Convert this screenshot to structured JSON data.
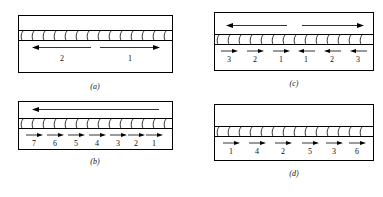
{
  "figure": {
    "caption_style": "italic-parenthetical",
    "panels": [
      {
        "id": "a",
        "caption": "(a)",
        "top_arrows": [],
        "segments": [
          {
            "label": "2",
            "direction": "left"
          },
          {
            "label": "1",
            "direction": "right"
          }
        ]
      },
      {
        "id": "b",
        "caption": "(b)",
        "top_arrows": [
          {
            "direction": "left",
            "span": "full"
          }
        ],
        "segments": [
          {
            "label": "7",
            "direction": "right"
          },
          {
            "label": "6",
            "direction": "right"
          },
          {
            "label": "5",
            "direction": "right"
          },
          {
            "label": "4",
            "direction": "right"
          },
          {
            "label": "3",
            "direction": "right"
          },
          {
            "label": "2",
            "direction": "right"
          },
          {
            "label": "1",
            "direction": "right"
          }
        ]
      },
      {
        "id": "c",
        "caption": "(c)",
        "top_arrows": [
          {
            "direction": "left",
            "span": "left-half"
          },
          {
            "direction": "right",
            "span": "right-half"
          }
        ],
        "segments": [
          {
            "label": "3",
            "direction": "right"
          },
          {
            "label": "2",
            "direction": "right"
          },
          {
            "label": "1",
            "direction": "right"
          },
          {
            "label": "1",
            "direction": "left"
          },
          {
            "label": "2",
            "direction": "left"
          },
          {
            "label": "3",
            "direction": "left"
          }
        ]
      },
      {
        "id": "d",
        "caption": "(d)",
        "top_arrows": [],
        "segments": [
          {
            "label": "1",
            "direction": "right"
          },
          {
            "label": "4",
            "direction": "right"
          },
          {
            "label": "2",
            "direction": "right"
          },
          {
            "label": "5",
            "direction": "right"
          },
          {
            "label": "3",
            "direction": "right"
          },
          {
            "label": "6",
            "direction": "right"
          }
        ]
      }
    ]
  },
  "colors": {
    "line": "#000000",
    "background": "#ffffff",
    "text": "#111111"
  }
}
